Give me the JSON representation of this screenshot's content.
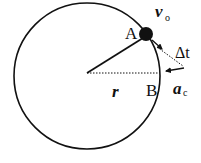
{
  "diagram": {
    "labels": {
      "point_a": "A",
      "point_b": "B",
      "velocity": "v",
      "velocity_sub": "o",
      "time_interval": "Δt",
      "acceleration": "a",
      "acceleration_sub": "c",
      "radius": "r"
    },
    "geometry": {
      "center": [
        87,
        73
      ],
      "radius": 73,
      "ball": [
        146,
        33
      ],
      "point_b": [
        160,
        73
      ]
    },
    "colors": {
      "stroke": "#111111",
      "background": "#ffffff"
    }
  }
}
